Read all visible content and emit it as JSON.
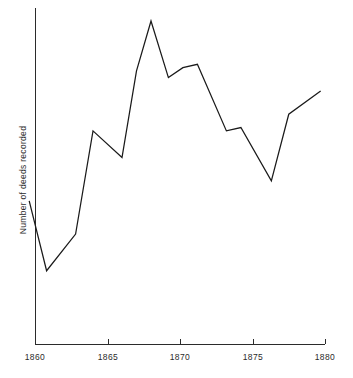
{
  "chart_data": {
    "type": "line",
    "title": "",
    "xlabel": "",
    "ylabel": "Number of deeds recorded",
    "xlim": [
      1859,
      1880
    ],
    "ylim": [
      0,
      100
    ],
    "grid": false,
    "legend": "none",
    "xticks": [
      1860,
      1865,
      1870,
      1875,
      1880
    ],
    "xticklabels": [
      "1860",
      "1865",
      "1870",
      "1875",
      "1880"
    ],
    "yticks": [],
    "yticklabels": [],
    "series": [
      {
        "name": "Number of deeds recorded",
        "color": "#1a1a1a",
        "x": [
          1859.6,
          1860.8,
          1862.8,
          1864.0,
          1866.0,
          1867.0,
          1868.0,
          1869.2,
          1870.2,
          1871.2,
          1873.2,
          1874.2,
          1876.3,
          1877.5,
          1879.7
        ],
        "y": [
          43,
          22,
          33,
          64,
          56,
          82,
          97,
          80,
          83,
          84,
          64,
          65,
          49,
          69,
          76
        ]
      }
    ]
  },
  "axis": {
    "y_title": "Number of deeds recorded",
    "x_tick_labels": [
      "1860",
      "1865",
      "1870",
      "1875",
      "1880"
    ]
  },
  "colors": {
    "axis": "#2b2b2b",
    "line": "#1a1a1a",
    "background": "#ffffff",
    "text": "#2b2b2b"
  }
}
